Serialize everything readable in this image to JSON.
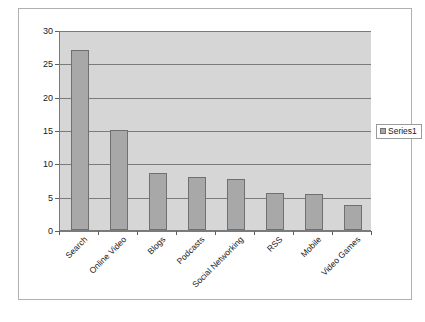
{
  "chart_data": {
    "type": "bar",
    "title": "",
    "subtitle": "",
    "xlabel": "",
    "ylabel": "",
    "categories": [
      "Search",
      "Online Video",
      "Blogs",
      "Podcasts",
      "Social Networking",
      "RSS",
      "Mobile",
      "Video Games"
    ],
    "series": [
      {
        "name": "Series1",
        "values": [
          27,
          15,
          8.5,
          8,
          7.6,
          5.6,
          5.4,
          3.7
        ]
      }
    ],
    "ylim": [
      0,
      30
    ],
    "yticks": [
      0,
      5,
      10,
      15,
      20,
      25,
      30
    ],
    "ytick_labels": [
      "0",
      "5",
      "10",
      "15",
      "20",
      "25",
      "30"
    ],
    "grid": true,
    "grid_axis": "y",
    "legend": {
      "position": "right",
      "entries": [
        {
          "label": "Series1",
          "color": "#a8a8a8"
        }
      ]
    },
    "colors": {
      "bar_fill": "#a8a8a8",
      "bar_border": "#707070",
      "plot_background": "#d6d6d6",
      "gridline": "#7b7b7b",
      "axis": "#7a7a7a",
      "text": "#1a1a1a",
      "chart_border": "#b0b0b0",
      "page_background": "#ffffff"
    }
  },
  "legend": {
    "series1_label": "Series1"
  },
  "axes": {
    "y_labels": [
      "30",
      "25",
      "20",
      "15",
      "10",
      "5",
      "0"
    ],
    "x_labels": [
      "Search",
      "Online Video",
      "Blogs",
      "Podcasts",
      "Social Networking",
      "RSS",
      "Mobile",
      "Video Games"
    ]
  }
}
